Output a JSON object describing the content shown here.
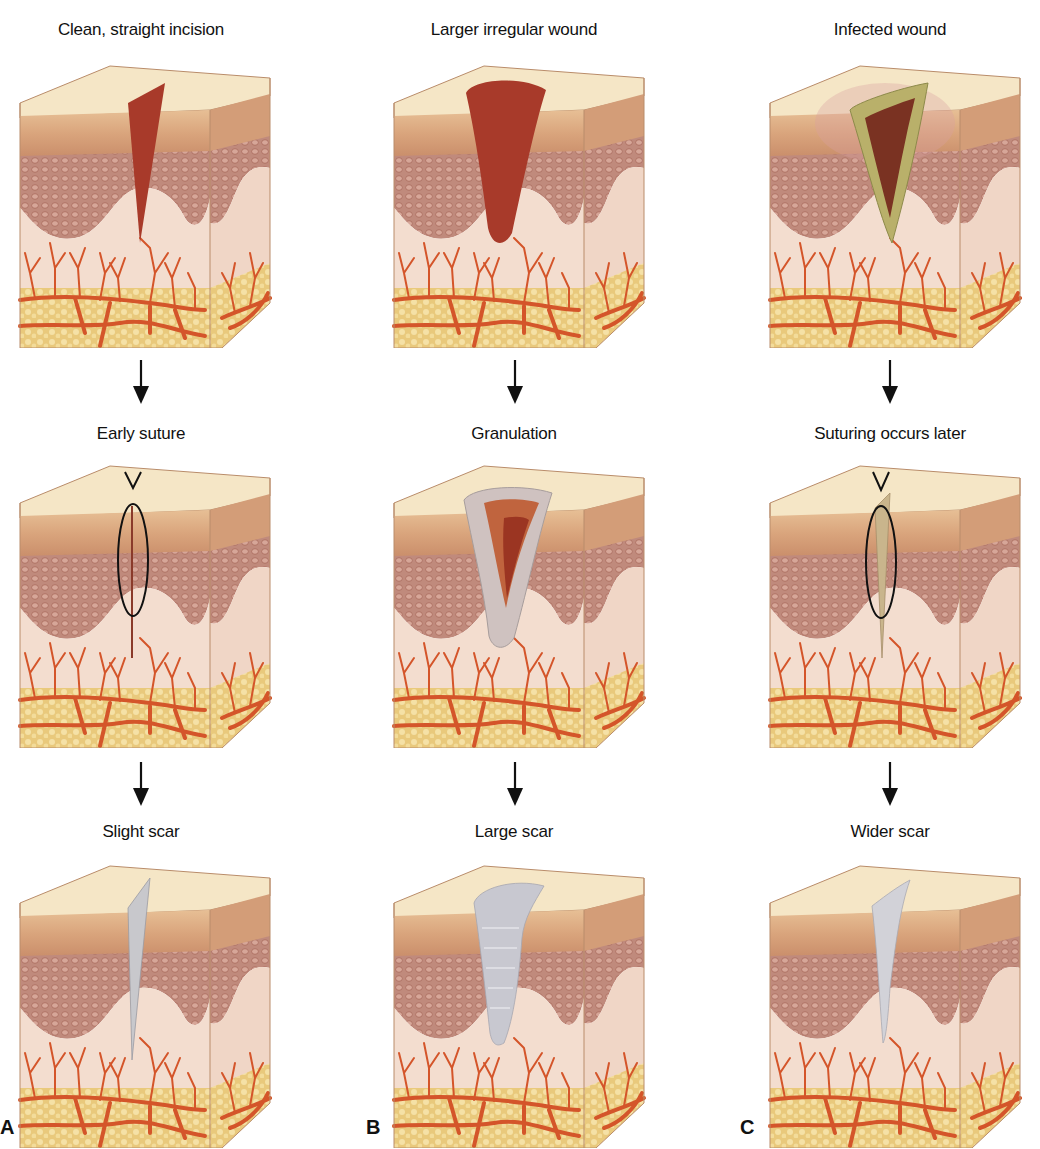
{
  "columns": [
    {
      "letter": "A",
      "stages": [
        {
          "label": "Clean, straight incision",
          "wound": "incision"
        },
        {
          "label": "Early suture",
          "wound": "sutured-thin"
        },
        {
          "label": "Slight scar",
          "wound": "thin-scar"
        }
      ]
    },
    {
      "letter": "B",
      "stages": [
        {
          "label": "Larger irregular wound",
          "wound": "large-wound"
        },
        {
          "label": "Granulation",
          "wound": "granulation"
        },
        {
          "label": "Large scar",
          "wound": "large-scar"
        }
      ]
    },
    {
      "letter": "C",
      "stages": [
        {
          "label": "Infected wound",
          "wound": "infected"
        },
        {
          "label": "Suturing occurs later",
          "wound": "sutured-late"
        },
        {
          "label": "Wider scar",
          "wound": "wide-scar"
        }
      ]
    }
  ],
  "colors": {
    "skin_top": "#f3e2c0",
    "epidermis": "#d9a67f",
    "dermis_cells": "#b77a6c",
    "dermis": "#f2ddd0",
    "fat": "#ecd08a",
    "vessels": "#d4552a",
    "wound_red": "#a83a2a",
    "infected_green": "#b9b06a",
    "scar_gray": "#c8c8cc",
    "suture": "#111111"
  }
}
